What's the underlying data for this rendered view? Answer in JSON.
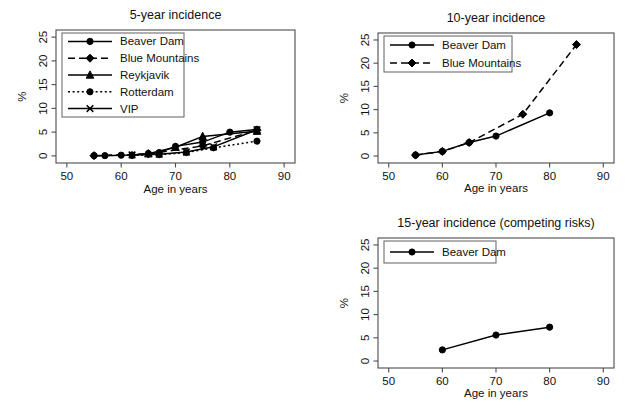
{
  "figure": {
    "axis_x_title": "Age in years",
    "axis_y_title": "%"
  },
  "chart_data": [
    {
      "id": "five-year",
      "type": "line",
      "title": "5-year incidence",
      "xlabel": "Age in years",
      "ylabel": "%",
      "xlim": [
        48,
        92
      ],
      "ylim": [
        -1.5,
        26.5
      ],
      "xticks": [
        50,
        60,
        70,
        80,
        90
      ],
      "yticks": [
        0,
        5,
        10,
        15,
        20,
        25
      ],
      "grid": false,
      "legend_position": "top-left",
      "series": [
        {
          "name": "Beaver Dam",
          "marker": "circle",
          "dash": "solid",
          "x": [
            55,
            57,
            60,
            62,
            65,
            67,
            70,
            75,
            80,
            85
          ],
          "y": [
            0.05,
            0.05,
            0.15,
            0.2,
            0.5,
            0.7,
            2.0,
            2.9,
            5.0,
            5.6
          ]
        },
        {
          "name": "Blue Mountains",
          "marker": "diamond",
          "dash": "dashed",
          "x": [
            55,
            65,
            75,
            85
          ],
          "y": [
            0.05,
            0.4,
            2.1,
            5.4
          ]
        },
        {
          "name": "Reykjavik",
          "marker": "triangle",
          "dash": "solid",
          "x": [
            65,
            70,
            75,
            85
          ],
          "y": [
            0.45,
            1.8,
            4.1,
            5.2
          ]
        },
        {
          "name": "Rotterdam",
          "marker": "circle",
          "dash": "dotted",
          "x": [
            62,
            67,
            72,
            77,
            85
          ],
          "y": [
            0.1,
            0.25,
            0.7,
            1.7,
            3.1
          ]
        },
        {
          "name": "VIP",
          "marker": "x",
          "dash": "solid",
          "x": [
            62,
            67,
            72,
            77,
            85
          ],
          "y": [
            0.2,
            0.35,
            0.8,
            1.9,
            5.5
          ]
        }
      ]
    },
    {
      "id": "ten-year",
      "type": "line",
      "title": "10-year incidence",
      "xlabel": "Age in years",
      "ylabel": "%",
      "xlim": [
        48,
        92
      ],
      "ylim": [
        -1.5,
        26.5
      ],
      "xticks": [
        50,
        60,
        70,
        80,
        90
      ],
      "yticks": [
        0,
        5,
        10,
        15,
        20,
        25
      ],
      "grid": false,
      "legend_position": "top-left",
      "series": [
        {
          "name": "Beaver Dam",
          "marker": "circle",
          "dash": "solid",
          "x": [
            55,
            60,
            65,
            70,
            80
          ],
          "y": [
            0.2,
            1.0,
            2.9,
            4.3,
            9.3
          ]
        },
        {
          "name": "Blue Mountains",
          "marker": "diamond",
          "dash": "dashed",
          "x": [
            55,
            60,
            65,
            75,
            85
          ],
          "y": [
            0.2,
            1.0,
            2.9,
            9.0,
            24.0
          ]
        }
      ]
    },
    {
      "id": "fifteen-year",
      "type": "line",
      "title": "15-year incidence (competing risks)",
      "xlabel": "Age in years",
      "ylabel": "%",
      "xlim": [
        48,
        92
      ],
      "ylim": [
        -1.5,
        26.5
      ],
      "xticks": [
        50,
        60,
        70,
        80,
        90
      ],
      "yticks": [
        0,
        5,
        10,
        15,
        20,
        25
      ],
      "grid": false,
      "legend_position": "top-left",
      "series": [
        {
          "name": "Beaver Dam",
          "marker": "circle",
          "dash": "solid",
          "x": [
            60,
            70,
            80
          ],
          "y": [
            2.4,
            5.6,
            7.3
          ]
        }
      ]
    }
  ]
}
